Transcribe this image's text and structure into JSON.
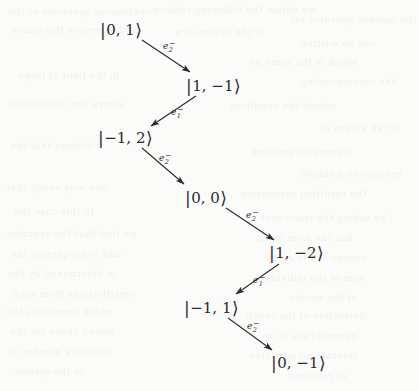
{
  "figure": {
    "type": "cascade-chain-diagram",
    "background_color": "#fbfbfa",
    "ink_color": "#2b2b2b"
  },
  "nodes": [
    {
      "id": "n0",
      "label": "|0, 1⟩",
      "bar": "|",
      "body": "0, 1",
      "angle": "⟩",
      "x": 100,
      "y": 22
    },
    {
      "id": "n1",
      "label": "|1, −1⟩",
      "bar": "|",
      "body": "1, −1",
      "angle": "⟩",
      "x": 186,
      "y": 78
    },
    {
      "id": "n2",
      "label": "|−1, 2⟩",
      "bar": "|",
      "body": "−1, 2",
      "angle": "⟩",
      "x": 98,
      "y": 130
    },
    {
      "id": "n3",
      "label": "|0, 0⟩",
      "bar": "|",
      "body": "0, 0",
      "angle": "⟩",
      "x": 185,
      "y": 190
    },
    {
      "id": "n4",
      "label": "|1, −2⟩",
      "bar": "|",
      "body": "1, −2",
      "angle": "⟩",
      "x": 269,
      "y": 245
    },
    {
      "id": "n5",
      "label": "|−1, 1⟩",
      "bar": "|",
      "body": "−1, 1",
      "angle": "⟩",
      "x": 184,
      "y": 300
    },
    {
      "id": "n6",
      "label": "|0, −1⟩",
      "bar": "|",
      "body": "0, −1",
      "angle": "⟩",
      "x": 271,
      "y": 355
    }
  ],
  "edges": [
    {
      "id": "e0",
      "from": "n0",
      "to": "n1",
      "particle": "e",
      "sub": "2",
      "sup": "−",
      "label": "e₂⁻",
      "x1": 142,
      "y1": 40,
      "x2": 190,
      "y2": 72,
      "lx": 163,
      "ly": 40
    },
    {
      "id": "e1",
      "from": "n1",
      "to": "n2",
      "particle": "e",
      "sub": "1",
      "sup": "−",
      "label": "e₁⁻",
      "x1": 196,
      "y1": 96,
      "x2": 151,
      "y2": 126,
      "lx": 171,
      "ly": 106
    },
    {
      "id": "e2",
      "from": "n2",
      "to": "n3",
      "particle": "e",
      "sub": "2",
      "sup": "−",
      "label": "e₂⁻",
      "x1": 142,
      "y1": 148,
      "x2": 184,
      "y2": 184,
      "lx": 159,
      "ly": 152
    },
    {
      "id": "e3",
      "from": "n3",
      "to": "n4",
      "particle": "e",
      "sub": "2",
      "sup": "−",
      "label": "e₂⁻",
      "x1": 226,
      "y1": 208,
      "x2": 274,
      "y2": 240,
      "lx": 246,
      "ly": 209
    },
    {
      "id": "e4",
      "from": "n4",
      "to": "n5",
      "particle": "e",
      "sub": "1",
      "sup": "−",
      "label": "e₁⁻",
      "x1": 279,
      "y1": 264,
      "x2": 236,
      "y2": 294,
      "lx": 253,
      "ly": 274
    },
    {
      "id": "e5",
      "from": "n5",
      "to": "n6",
      "particle": "e",
      "sub": "2",
      "sup": "−",
      "label": "e₂⁻",
      "x1": 228,
      "y1": 318,
      "x2": 272,
      "y2": 350,
      "lx": 247,
      "ly": 320
    }
  ],
  "background_ghost": {
    "note": "illegible bleed-through text from reverse side of scanned page",
    "lines": [
      {
        "text": "a continuous spectrum of the",
        "x": 8,
        "y": 6
      },
      {
        "text": "we obtain the following relation",
        "x": 150,
        "y": 4
      },
      {
        "text": "the number operator for",
        "x": 290,
        "y": 14
      },
      {
        "text": "and therefore the states",
        "x": 12,
        "y": 24
      },
      {
        "text": "of the system are",
        "x": 175,
        "y": 26
      },
      {
        "text": "can be written",
        "x": 300,
        "y": 38
      },
      {
        "text": "which is the same as",
        "x": 250,
        "y": 56
      },
      {
        "text": "in the limit of large",
        "x": 18,
        "y": 70
      },
      {
        "text": "the corresponding",
        "x": 300,
        "y": 76
      },
      {
        "text": "where the coefficients",
        "x": 8,
        "y": 98
      },
      {
        "text": "satisfy the condition",
        "x": 230,
        "y": 100
      },
      {
        "text": "for all values of",
        "x": 320,
        "y": 122
      },
      {
        "text": "It follows that the",
        "x": 10,
        "y": 140
      },
      {
        "text": "eigenvalue problem",
        "x": 250,
        "y": 146
      },
      {
        "text": "reduces to a simple",
        "x": 300,
        "y": 168
      },
      {
        "text": "one may verify that",
        "x": 6,
        "y": 182
      },
      {
        "text": "the resulting expression",
        "x": 240,
        "y": 188
      },
      {
        "text": "In this case the",
        "x": 14,
        "y": 206
      },
      {
        "text": "by taking the trace over",
        "x": 260,
        "y": 212
      },
      {
        "text": "we find that the operator",
        "x": 6,
        "y": 228
      },
      {
        "text": "has the form given",
        "x": 255,
        "y": 232
      },
      {
        "text": "and consequently the",
        "x": 10,
        "y": 248
      },
      {
        "text": "energy of the state",
        "x": 268,
        "y": 252
      },
      {
        "text": "is determined by the",
        "x": 8,
        "y": 268
      },
      {
        "text": "sum of the individual",
        "x": 255,
        "y": 272
      },
      {
        "text": "contributions from each",
        "x": 12,
        "y": 288
      },
      {
        "text": "of the modes",
        "x": 290,
        "y": 292
      },
      {
        "text": "which completes the",
        "x": 6,
        "y": 306
      },
      {
        "text": "derivation of the result",
        "x": 245,
        "y": 310
      },
      {
        "text": "stated above for the",
        "x": 10,
        "y": 326
      },
      {
        "text": "general case of an",
        "x": 262,
        "y": 330
      },
      {
        "text": "arbitrary number of",
        "x": 8,
        "y": 346
      },
      {
        "text": "interacting particles",
        "x": 250,
        "y": 350
      },
      {
        "text": "in the system",
        "x": 14,
        "y": 366
      },
      {
        "text": "as required",
        "x": 288,
        "y": 370
      }
    ]
  }
}
